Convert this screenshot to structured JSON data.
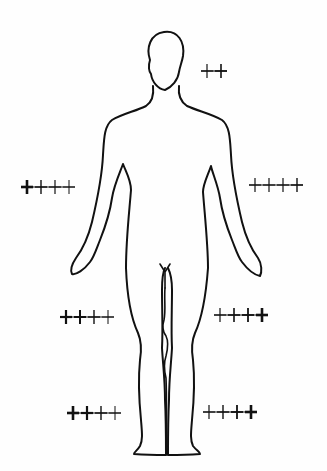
{
  "figure": {
    "title": "Human body outline with plus-sign intensity markers",
    "ink_color": "#111111",
    "background": "#fefefe"
  },
  "markers": [
    {
      "id": "head-right",
      "label": "++",
      "count": 2,
      "x": 200,
      "y": 71,
      "weights": [
        1.2,
        1.6
      ]
    },
    {
      "id": "upper-arm-left",
      "label": "++++",
      "count": 4,
      "x": 20,
      "y": 187,
      "weights": [
        2.6,
        1.4,
        1.2,
        1.0
      ]
    },
    {
      "id": "upper-arm-right",
      "label": "++++",
      "count": 4,
      "x": 248,
      "y": 185,
      "weights": [
        1.2,
        1.2,
        1.2,
        1.4
      ]
    },
    {
      "id": "thigh-left",
      "label": "++++",
      "count": 4,
      "x": 59,
      "y": 317,
      "weights": [
        2.2,
        2.0,
        1.4,
        1.0
      ]
    },
    {
      "id": "thigh-right",
      "label": "++++",
      "count": 4,
      "x": 213,
      "y": 315,
      "weights": [
        1.2,
        1.6,
        1.8,
        2.6
      ]
    },
    {
      "id": "ankle-left",
      "label": "++++",
      "count": 4,
      "x": 66,
      "y": 413,
      "weights": [
        2.6,
        2.2,
        1.4,
        1.0
      ]
    },
    {
      "id": "ankle-right",
      "label": "++++",
      "count": 4,
      "x": 202,
      "y": 412,
      "weights": [
        1.2,
        1.4,
        1.8,
        2.6
      ]
    }
  ]
}
